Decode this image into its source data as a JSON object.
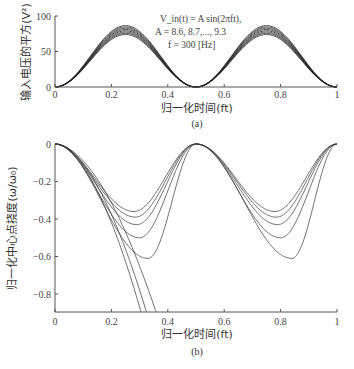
{
  "chart_data": [
    {
      "type": "line",
      "panel": "(a)",
      "xlabel": "归一化时间(ft)",
      "ylabel": "输入电压的平方(V²)",
      "xlim": [
        0,
        1
      ],
      "ylim": [
        0,
        100
      ],
      "xticks": [
        "0",
        "0.2",
        "0.4",
        "0.6",
        "0.8",
        "1"
      ],
      "yticks": [
        "0",
        "50",
        "100"
      ],
      "annotation": [
        "V_in(t) = A sin(2πft),",
        "A = 8.6, 8.7,..., 9.3",
        "f = 300 [Hz]"
      ],
      "formula": "V^2 = A^2 sin^2(2πft)",
      "series": [
        {
          "name": "A=8.6",
          "peak": 73.96
        },
        {
          "name": "A=8.7",
          "peak": 75.69
        },
        {
          "name": "A=8.8",
          "peak": 77.44
        },
        {
          "name": "A=8.9",
          "peak": 79.21
        },
        {
          "name": "A=9.0",
          "peak": 81.0
        },
        {
          "name": "A=9.1",
          "peak": 82.81
        },
        {
          "name": "A=9.2",
          "peak": 84.64
        },
        {
          "name": "A=9.3",
          "peak": 86.49
        }
      ],
      "grid": false
    },
    {
      "type": "line",
      "panel": "(b)",
      "xlabel": "归一化时间(ft)",
      "ylabel": "归一化中心点挠度(ω/ω₀)",
      "xlim": [
        0,
        1
      ],
      "ylim": [
        -0.9,
        0
      ],
      "xticks": [
        "0",
        "0.2",
        "0.4",
        "0.6",
        "0.8",
        "1"
      ],
      "yticks": [
        "0",
        "-0.2",
        "-0.4",
        "-0.6",
        "-0.8"
      ],
      "series": [
        {
          "name": "A=8.6",
          "min1_x": 0.28,
          "min1": -0.36,
          "min2_x": 0.78,
          "min2": -0.36,
          "diverges": false
        },
        {
          "name": "A=8.7",
          "min1_x": 0.285,
          "min1": -0.39,
          "min2_x": 0.785,
          "min2": -0.39,
          "diverges": false
        },
        {
          "name": "A=8.8",
          "min1_x": 0.29,
          "min1": -0.43,
          "min2_x": 0.79,
          "min2": -0.43,
          "diverges": false
        },
        {
          "name": "A=8.9",
          "min1_x": 0.3,
          "min1": -0.5,
          "min2_x": 0.8,
          "min2": -0.5,
          "diverges": false
        },
        {
          "name": "A=9.0",
          "min1_x": 0.33,
          "min1": -0.61,
          "min2_x": 0.84,
          "min2": -0.61,
          "diverges": false
        },
        {
          "name": "A=9.1",
          "exit_x": 0.37,
          "diverges": true
        },
        {
          "name": "A=9.2",
          "exit_x": 0.335,
          "diverges": true
        },
        {
          "name": "A=9.3",
          "exit_x": 0.315,
          "diverges": true
        }
      ],
      "grid": false
    }
  ]
}
